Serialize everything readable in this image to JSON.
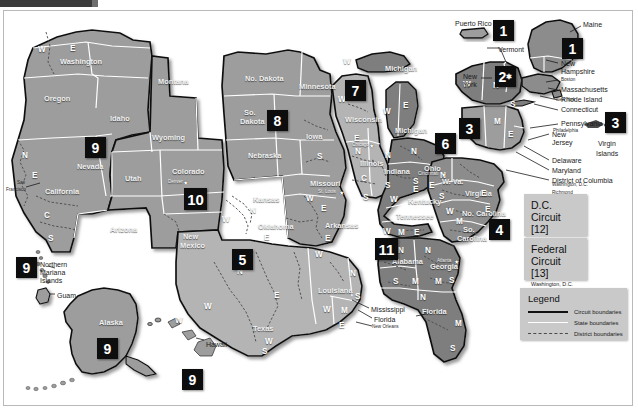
{
  "colors": {
    "badge_bg": "#0d0d0d",
    "badge_fg": "#ffffff",
    "land_light": "#b4b4b4",
    "land_mid": "#9d9d9d",
    "land_dark": "#7e7e7e",
    "panel_bg": "#c9c9c9",
    "circuit_boundary": "#111111",
    "state_boundary": "#ffffff",
    "district_boundary": "#4a4a4a",
    "page_bg": "#ffffff"
  },
  "badges": [
    {
      "id": "pr-1",
      "label": "1",
      "star": false,
      "x": 493,
      "y": 20,
      "size": "sm"
    },
    {
      "id": "ne-1",
      "label": "1",
      "star": false,
      "x": 562,
      "y": 38,
      "size": "sm"
    },
    {
      "id": "ny-2",
      "label": "2",
      "star": true,
      "x": 495,
      "y": 66,
      "size": "sm"
    },
    {
      "id": "pa-3",
      "label": "3",
      "x": 459,
      "y": 118,
      "size": "sm",
      "star": false
    },
    {
      "id": "vi-3",
      "label": "3",
      "x": 605,
      "y": 112,
      "size": "sm",
      "star": false
    },
    {
      "id": "va-4",
      "label": "4",
      "x": 489,
      "y": 219,
      "size": "sm",
      "star": false
    },
    {
      "id": "tx-5",
      "label": "5",
      "x": 232,
      "y": 249,
      "size": "sm",
      "star": false
    },
    {
      "id": "oh-6",
      "label": "6",
      "x": 435,
      "y": 133,
      "size": "sm",
      "star": false
    },
    {
      "id": "il-7",
      "label": "7",
      "x": 345,
      "y": 80,
      "size": "sm",
      "star": false
    },
    {
      "id": "sd-8",
      "label": "8",
      "x": 267,
      "y": 110,
      "size": "sm",
      "star": false
    },
    {
      "id": "nv-9",
      "label": "9",
      "x": 85,
      "y": 137,
      "size": "sm",
      "star": false
    },
    {
      "id": "mp-9",
      "label": "9",
      "x": 16,
      "y": 257,
      "size": "sm",
      "star": false
    },
    {
      "id": "ak-9",
      "label": "9",
      "x": 97,
      "y": 338,
      "size": "sm",
      "star": false
    },
    {
      "id": "hi-9",
      "label": "9",
      "x": 182,
      "y": 369,
      "size": "sm",
      "star": false
    },
    {
      "id": "co-10",
      "label": "10",
      "x": 184,
      "y": 188,
      "size": "md",
      "star": false
    },
    {
      "id": "al-11",
      "label": "11",
      "x": 375,
      "y": 238,
      "size": "md",
      "star": false
    }
  ],
  "states": [
    {
      "name": "Washington",
      "x": 60,
      "y": 58,
      "shade": "dk"
    },
    {
      "name": "Oregon",
      "x": 44,
      "y": 95,
      "shade": "dk"
    },
    {
      "name": "Idaho",
      "x": 110,
      "y": 115,
      "shade": "dk"
    },
    {
      "name": "Montana",
      "x": 158,
      "y": 78,
      "shade": "dk"
    },
    {
      "name": "Nevada",
      "x": 77,
      "y": 163,
      "shade": "dk"
    },
    {
      "name": "California",
      "x": 45,
      "y": 188,
      "shade": "dk"
    },
    {
      "name": "Utah",
      "x": 125,
      "y": 175,
      "shade": "dk"
    },
    {
      "name": "Arizona",
      "x": 110,
      "y": 226,
      "shade": "dk"
    },
    {
      "name": "Wyoming",
      "x": 152,
      "y": 134,
      "shade": "dk"
    },
    {
      "name": "Colorado",
      "x": 172,
      "y": 168,
      "shade": "dk"
    },
    {
      "name": "New",
      "x": 183,
      "y": 233,
      "shade": "dk"
    },
    {
      "name": "Mexico",
      "x": 180,
      "y": 242,
      "shade": "dk"
    },
    {
      "name": "No. Dakota",
      "x": 245,
      "y": 75,
      "shade": "dk"
    },
    {
      "name": "So.",
      "x": 244,
      "y": 109,
      "shade": "dk"
    },
    {
      "name": "Dakota",
      "x": 240,
      "y": 118,
      "shade": "dk"
    },
    {
      "name": "Nebraska",
      "x": 248,
      "y": 152,
      "shade": "dk"
    },
    {
      "name": "Kansas",
      "x": 253,
      "y": 196,
      "shade": "dk"
    },
    {
      "name": "Oklahoma",
      "x": 258,
      "y": 223,
      "shade": "dk"
    },
    {
      "name": "Texas",
      "x": 253,
      "y": 325,
      "shade": "dk"
    },
    {
      "name": "Minnesota",
      "x": 299,
      "y": 83,
      "shade": "dk"
    },
    {
      "name": "Iowa",
      "x": 306,
      "y": 133,
      "shade": "dk"
    },
    {
      "name": "Missouri",
      "x": 310,
      "y": 180,
      "shade": "dk"
    },
    {
      "name": "Arkansas",
      "x": 325,
      "y": 222,
      "shade": "dk"
    },
    {
      "name": "Louisiana",
      "x": 318,
      "y": 287,
      "shade": "dk"
    },
    {
      "name": "Wisconsin",
      "x": 345,
      "y": 116,
      "shade": "dk"
    },
    {
      "name": "Illinois",
      "x": 360,
      "y": 160,
      "shade": "dk"
    },
    {
      "name": "Indiana",
      "x": 384,
      "y": 168,
      "shade": "dk"
    },
    {
      "name": "Michigan",
      "x": 385,
      "y": 65,
      "shade": "dk"
    },
    {
      "name": "Michigan",
      "x": 395,
      "y": 127,
      "shade": "dk"
    },
    {
      "name": "Ohio",
      "x": 424,
      "y": 165,
      "shade": "dk"
    },
    {
      "name": "Kentucky",
      "x": 408,
      "y": 198,
      "shade": "dk"
    },
    {
      "name": "Tennessee",
      "x": 396,
      "y": 213,
      "shade": "dk"
    },
    {
      "name": "W. Va.",
      "x": 442,
      "y": 178,
      "shade": "dk"
    },
    {
      "name": "Virginia",
      "x": 465,
      "y": 190,
      "shade": "dk"
    },
    {
      "name": "No. Carolina",
      "x": 462,
      "y": 210,
      "shade": "dk"
    },
    {
      "name": "So.",
      "x": 463,
      "y": 226,
      "shade": "dk"
    },
    {
      "name": "Carolina",
      "x": 457,
      "y": 235,
      "shade": "dk"
    },
    {
      "name": "Alabama",
      "x": 392,
      "y": 258,
      "shade": "dk"
    },
    {
      "name": "Georgia",
      "x": 430,
      "y": 263,
      "shade": "dk"
    },
    {
      "name": "Florida",
      "x": 422,
      "y": 308,
      "shade": "dk"
    },
    {
      "name": "Alaska",
      "x": 99,
      "y": 319,
      "shade": "dk"
    }
  ],
  "districts": [
    {
      "label": "W",
      "x": 38,
      "y": 46
    },
    {
      "label": "E",
      "x": 70,
      "y": 45
    },
    {
      "label": "N",
      "x": 22,
      "y": 152
    },
    {
      "label": "E",
      "x": 32,
      "y": 172
    },
    {
      "label": "C",
      "x": 44,
      "y": 212
    },
    {
      "label": "S",
      "x": 48,
      "y": 235
    },
    {
      "label": "W",
      "x": 222,
      "y": 216
    },
    {
      "label": "N",
      "x": 250,
      "y": 207
    },
    {
      "label": "E",
      "x": 264,
      "y": 234
    },
    {
      "label": "N",
      "x": 237,
      "y": 268
    },
    {
      "label": "E",
      "x": 274,
      "y": 292
    },
    {
      "label": "W",
      "x": 204,
      "y": 303
    },
    {
      "label": "S",
      "x": 262,
      "y": 348
    },
    {
      "label": "W",
      "x": 306,
      "y": 195
    },
    {
      "label": "E",
      "x": 321,
      "y": 205
    },
    {
      "label": "E",
      "x": 325,
      "y": 235
    },
    {
      "label": "W",
      "x": 315,
      "y": 251
    },
    {
      "label": "W",
      "x": 323,
      "y": 306
    },
    {
      "label": "M",
      "x": 341,
      "y": 307
    },
    {
      "label": "E",
      "x": 339,
      "y": 322
    },
    {
      "label": "N",
      "x": 350,
      "y": 270
    },
    {
      "label": "S",
      "x": 355,
      "y": 293
    },
    {
      "label": "W",
      "x": 338,
      "y": 96
    },
    {
      "label": "E",
      "x": 354,
      "y": 135
    },
    {
      "label": "N",
      "x": 355,
      "y": 148
    },
    {
      "label": "C",
      "x": 361,
      "y": 175
    },
    {
      "label": "S",
      "x": 363,
      "y": 194
    },
    {
      "label": "N",
      "x": 385,
      "y": 152
    },
    {
      "label": "S",
      "x": 385,
      "y": 182
    },
    {
      "label": "S",
      "x": 317,
      "y": 153
    },
    {
      "label": "W",
      "x": 343,
      "y": 58
    },
    {
      "label": "W",
      "x": 383,
      "y": 108
    },
    {
      "label": "E",
      "x": 403,
      "y": 102
    },
    {
      "label": "N",
      "x": 411,
      "y": 148
    },
    {
      "label": "S",
      "x": 413,
      "y": 178
    },
    {
      "label": "E",
      "x": 413,
      "y": 186
    },
    {
      "label": "W",
      "x": 390,
      "y": 196
    },
    {
      "label": "E",
      "x": 429,
      "y": 182
    },
    {
      "label": "W",
      "x": 383,
      "y": 228
    },
    {
      "label": "M",
      "x": 398,
      "y": 229
    },
    {
      "label": "E",
      "x": 414,
      "y": 229
    },
    {
      "label": "N",
      "x": 440,
      "y": 172
    },
    {
      "label": "S",
      "x": 439,
      "y": 193
    },
    {
      "label": "E",
      "x": 481,
      "y": 190
    },
    {
      "label": "W",
      "x": 446,
      "y": 208
    },
    {
      "label": "M",
      "x": 456,
      "y": 218
    },
    {
      "label": "E",
      "x": 485,
      "y": 206
    },
    {
      "label": "N",
      "x": 398,
      "y": 247
    },
    {
      "label": "S",
      "x": 393,
      "y": 278
    },
    {
      "label": "M",
      "x": 412,
      "y": 278
    },
    {
      "label": "N",
      "x": 425,
      "y": 247
    },
    {
      "label": "M",
      "x": 435,
      "y": 278
    },
    {
      "label": "S",
      "x": 449,
      "y": 277
    },
    {
      "label": "N",
      "x": 420,
      "y": 294
    },
    {
      "label": "M",
      "x": 455,
      "y": 320
    },
    {
      "label": "S",
      "x": 450,
      "y": 345
    },
    {
      "label": "W",
      "x": 463,
      "y": 81
    },
    {
      "label": "N",
      "x": 493,
      "y": 82
    },
    {
      "label": "S",
      "x": 510,
      "y": 101
    },
    {
      "label": "W",
      "x": 472,
      "y": 129
    },
    {
      "label": "M",
      "x": 494,
      "y": 118
    },
    {
      "label": "E",
      "x": 508,
      "y": 131
    },
    {
      "label": "W",
      "x": 265,
      "y": 338
    },
    {
      "label": "W",
      "x": 175,
      "y": 317
    }
  ],
  "cities": [
    {
      "name": "Denver",
      "x": 168,
      "y": 180,
      "tone": "w"
    },
    {
      "name": "San",
      "x": 17,
      "y": 181,
      "tone": "d"
    },
    {
      "name": "Francisco",
      "x": 6,
      "y": 188,
      "tone": "d"
    },
    {
      "name": "Chicago",
      "x": 352,
      "y": 143,
      "tone": "w"
    },
    {
      "name": "St. Louis",
      "x": 318,
      "y": 190,
      "tone": "w"
    },
    {
      "name": "Cincinnati",
      "x": 418,
      "y": 172,
      "tone": "w"
    },
    {
      "name": "Atlanta",
      "x": 437,
      "y": 259,
      "tone": "w"
    },
    {
      "name": "New Orleans",
      "x": 372,
      "y": 325,
      "tone": "d"
    },
    {
      "name": "Boston",
      "x": 561,
      "y": 78,
      "tone": "d"
    },
    {
      "name": "New York",
      "x": 556,
      "y": 98,
      "tone": "d"
    },
    {
      "name": "Philadelphia",
      "x": 553,
      "y": 129,
      "tone": "d"
    },
    {
      "name": "Washington, D.C.",
      "x": 552,
      "y": 183,
      "tone": "d"
    },
    {
      "name": "Richmond",
      "x": 552,
      "y": 191,
      "tone": "d"
    }
  ],
  "callouts": [
    {
      "name": "Puerto Rico",
      "x": 455,
      "y": 20,
      "size": "big"
    },
    {
      "name": "Maine",
      "x": 583,
      "y": 21,
      "size": "big"
    },
    {
      "name": "Vermont",
      "x": 498,
      "y": 46,
      "size": "big"
    },
    {
      "name": "New",
      "x": 463,
      "y": 73,
      "size": "big"
    },
    {
      "name": "York",
      "x": 463,
      "y": 81,
      "size": "big"
    },
    {
      "name": "New",
      "x": 561,
      "y": 60,
      "size": "big"
    },
    {
      "name": "Hampshire",
      "x": 561,
      "y": 68,
      "size": "big"
    },
    {
      "name": "Massachusetts",
      "x": 561,
      "y": 86,
      "size": "big"
    },
    {
      "name": "Rhode Island",
      "x": 561,
      "y": 96,
      "size": "big"
    },
    {
      "name": "Connecticut",
      "x": 561,
      "y": 106,
      "size": "big"
    },
    {
      "name": "Pennsylvania",
      "x": 561,
      "y": 120,
      "size": "big"
    },
    {
      "name": "New",
      "x": 552,
      "y": 131,
      "size": "big"
    },
    {
      "name": "Jersey",
      "x": 552,
      "y": 139,
      "size": "big"
    },
    {
      "name": "Delaware",
      "x": 552,
      "y": 157,
      "size": "big"
    },
    {
      "name": "Maryland",
      "x": 552,
      "y": 167,
      "size": "big"
    },
    {
      "name": "District of Columbia",
      "x": 552,
      "y": 177,
      "size": "big"
    },
    {
      "name": "Northern",
      "x": 40,
      "y": 261,
      "size": "big"
    },
    {
      "name": "Mariana",
      "x": 40,
      "y": 269,
      "size": "big"
    },
    {
      "name": "Islands",
      "x": 40,
      "y": 277,
      "size": "big"
    },
    {
      "name": "Guam",
      "x": 57,
      "y": 292,
      "size": "big"
    },
    {
      "name": "Hawaii",
      "x": 206,
      "y": 341,
      "size": "big"
    },
    {
      "name": "Virgin",
      "x": 598,
      "y": 140,
      "size": "big"
    },
    {
      "name": "Islands",
      "x": 596,
      "y": 150,
      "size": "big"
    },
    {
      "name": "Mississippi",
      "x": 371,
      "y": 306,
      "size": "big"
    },
    {
      "name": "Florida",
      "x": 374,
      "y": 316,
      "size": "big"
    }
  ],
  "info_boxes": [
    {
      "id": "dc-circuit",
      "line1": "D.C.",
      "line2": "Circuit [12]",
      "sub": "Washington, D.C.",
      "x": 524,
      "y": 194,
      "w": 63,
      "h": 42
    },
    {
      "id": "federal-circuit",
      "line1": "Federal",
      "line2": "Circuit [13]",
      "sub": "Washington, D.C.",
      "x": 524,
      "y": 238,
      "w": 63,
      "h": 42
    }
  ],
  "legend": {
    "title": "Legend",
    "x": 520,
    "y": 288,
    "w": 107,
    "h": 52,
    "items": [
      {
        "key": "circuit",
        "label": "Circuit boundaries"
      },
      {
        "key": "state",
        "label": "State boundaries"
      },
      {
        "key": "district",
        "label": "District boundaries"
      }
    ]
  }
}
